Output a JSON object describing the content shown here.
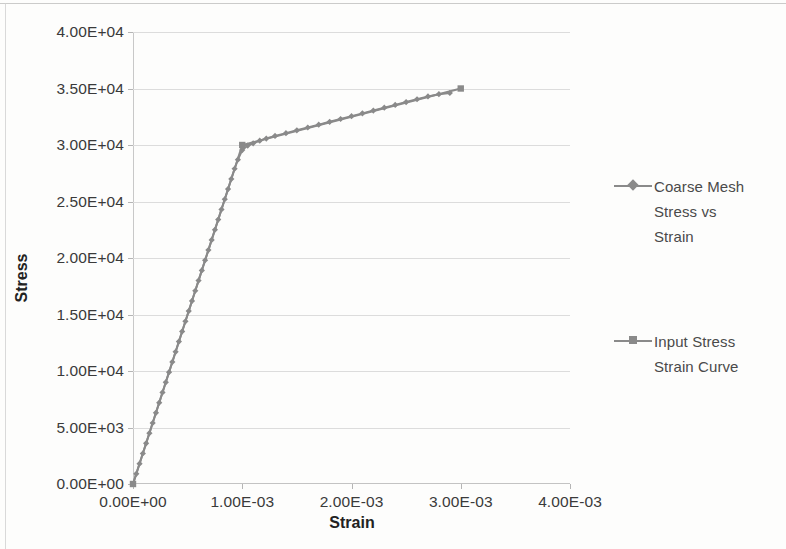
{
  "chart_data": {
    "type": "line",
    "title": "",
    "xlabel": "Strain",
    "ylabel": "Stress",
    "xlim": [
      0,
      0.004
    ],
    "ylim": [
      0,
      40000
    ],
    "grid": true,
    "legend_position": "right",
    "x_ticks": [
      "0.00E+00",
      "1.00E-03",
      "2.00E-03",
      "3.00E-03",
      "4.00E-03"
    ],
    "x_tick_values": [
      0,
      0.001,
      0.002,
      0.003,
      0.004
    ],
    "y_ticks": [
      "0.00E+00",
      "5.00E+03",
      "1.00E+04",
      "1.50E+04",
      "2.00E+04",
      "2.50E+04",
      "3.00E+04",
      "3.50E+04",
      "4.00E+04"
    ],
    "y_tick_values": [
      0,
      5000,
      10000,
      15000,
      20000,
      25000,
      30000,
      35000,
      40000
    ],
    "series": [
      {
        "name": "Coarse Mesh Stress vs Strain",
        "marker": "diamond",
        "color": "#8a8a8a",
        "x": [
          0.0,
          3e-05,
          6e-05,
          9e-05,
          0.00012,
          0.00015,
          0.00018,
          0.00021,
          0.00024,
          0.00027,
          0.0003,
          0.00033,
          0.00036,
          0.00039,
          0.00042,
          0.00045,
          0.00048,
          0.00051,
          0.00054,
          0.00057,
          0.0006,
          0.00063,
          0.00066,
          0.00069,
          0.00072,
          0.00075,
          0.00078,
          0.00081,
          0.00084,
          0.00087,
          0.0009,
          0.00093,
          0.00096,
          0.001,
          0.00105,
          0.0011,
          0.00116,
          0.00122,
          0.0013,
          0.0014,
          0.0015,
          0.0016,
          0.0017,
          0.0018,
          0.0019,
          0.002,
          0.0021,
          0.0022,
          0.0023,
          0.0024,
          0.0025,
          0.0026,
          0.0027,
          0.0028,
          0.0029
        ],
        "y": [
          0,
          900,
          1800,
          2700,
          3600,
          4500,
          5400,
          6300,
          7200,
          8100,
          9000,
          9900,
          10800,
          11700,
          12600,
          13500,
          14400,
          15300,
          16200,
          17100,
          18000,
          18900,
          19800,
          20700,
          21600,
          22500,
          23400,
          24300,
          25200,
          26100,
          27000,
          27900,
          28700,
          29550,
          29950,
          30150,
          30380,
          30570,
          30800,
          31050,
          31300,
          31550,
          31800,
          32050,
          32300,
          32550,
          32800,
          33050,
          33300,
          33550,
          33800,
          34050,
          34300,
          34500,
          34600
        ]
      },
      {
        "name": "Input Stress Strain Curve",
        "marker": "square",
        "color": "#8a8a8a",
        "x": [
          0.0,
          0.001,
          0.003
        ],
        "y": [
          0,
          30000,
          35000
        ]
      }
    ]
  },
  "legend": {
    "entries": [
      {
        "label": "Coarse Mesh\nStress  vs\nStrain",
        "marker": "diamond"
      },
      {
        "label": "Input Stress\nStrain Curve",
        "marker": "square"
      }
    ]
  },
  "axes": {
    "y_title": "Stress",
    "x_title": "Strain"
  }
}
